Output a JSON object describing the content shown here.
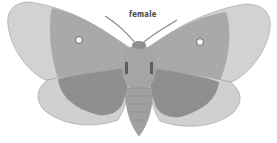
{
  "image": {
    "subject": "moth illustration",
    "caption": "female",
    "colors": {
      "background": "#ffffff",
      "wing_outer": "#d2d2d2",
      "wing_inner": "#a9a9a9",
      "hindwing_inner": "#8f8f8f",
      "body": "#9c9c9c",
      "eyespot": "#f4f4f4",
      "outline": "#7a7a7a"
    }
  }
}
